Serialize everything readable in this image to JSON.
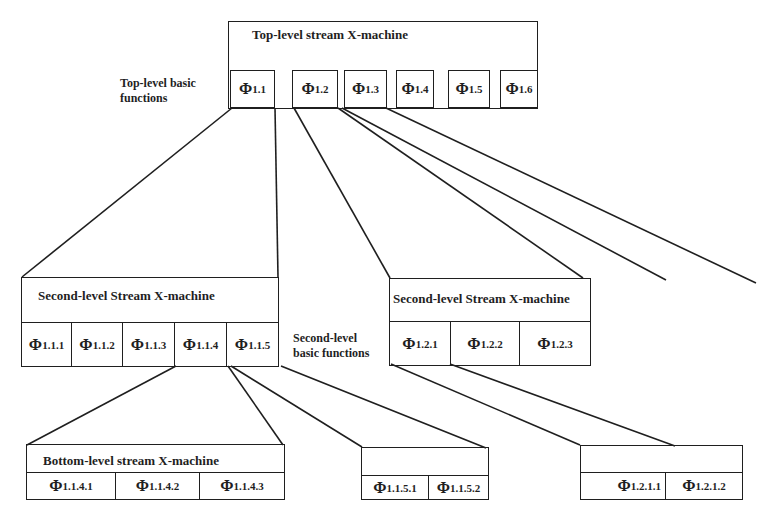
{
  "top": {
    "title": "Top-level stream X-machine",
    "functions_label_1": "Top-level basic",
    "functions_label_2": "functions",
    "cells": [
      {
        "sym": "Φ",
        "sub": "1.1"
      },
      {
        "sym": "Φ",
        "sub": "1.2"
      },
      {
        "sym": "Φ",
        "sub": "1.3"
      },
      {
        "sym": "Φ",
        "sub": "1.4"
      },
      {
        "sym": "Φ",
        "sub": "1.5"
      },
      {
        "sym": "Φ",
        "sub": "1.6"
      }
    ]
  },
  "second_left": {
    "title": "Second-level Stream X-machine",
    "cells": [
      {
        "sym": "Φ",
        "sub": "1.1.1"
      },
      {
        "sym": "Φ",
        "sub": "1.1.2"
      },
      {
        "sym": "Φ",
        "sub": "1.1.3"
      },
      {
        "sym": "Φ",
        "sub": "1.1.4"
      },
      {
        "sym": "Φ",
        "sub": "1.1.5"
      }
    ]
  },
  "second_right": {
    "title": "Second-level Stream X-machine",
    "cells": [
      {
        "sym": "Φ",
        "sub": "1.2.1"
      },
      {
        "sym": "Φ",
        "sub": "1.2.2"
      },
      {
        "sym": "Φ",
        "sub": "1.2.3"
      }
    ]
  },
  "second_functions_label_1": "Second-level",
  "second_functions_label_2": "basic functions",
  "bottom_left": {
    "title": "Bottom-level stream X-machine",
    "cells": [
      {
        "sym": "Φ",
        "sub": "1.1.4.1"
      },
      {
        "sym": "Φ",
        "sub": "1.1.4.2"
      },
      {
        "sym": "Φ",
        "sub": "1.1.4.3"
      }
    ]
  },
  "bottom_mid": {
    "title": "",
    "cells": [
      {
        "sym": "Φ",
        "sub": "1.1.5.1"
      },
      {
        "sym": "Φ",
        "sub": "1.1.5.2"
      }
    ]
  },
  "bottom_right": {
    "title": "",
    "cells": [
      {
        "sym": "Φ",
        "sub": "1.2.1.1"
      },
      {
        "sym": "Φ",
        "sub": "1.2.1.2"
      }
    ]
  }
}
